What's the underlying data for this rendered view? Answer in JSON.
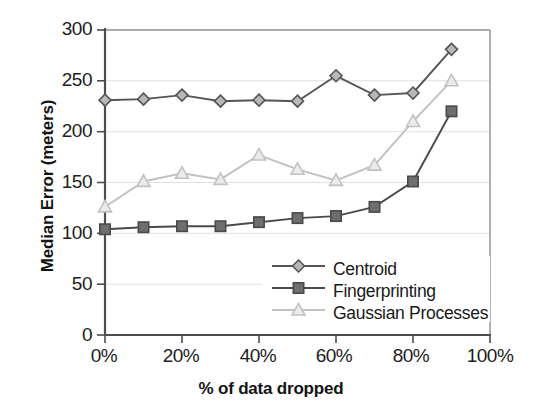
{
  "chart_data": {
    "type": "line",
    "title": "",
    "xlabel": "% of data dropped",
    "ylabel": "Median Error (meters)",
    "x": [
      0,
      10,
      20,
      30,
      40,
      50,
      60,
      70,
      80,
      90
    ],
    "categories": [
      "0%",
      "10%",
      "20%",
      "30%",
      "40%",
      "50%",
      "60%",
      "70%",
      "80%",
      "90%"
    ],
    "xlim": [
      0,
      100
    ],
    "ylim": [
      0,
      300
    ],
    "xticks": [
      0,
      20,
      40,
      60,
      80,
      100
    ],
    "xtick_labels": [
      "0%",
      "20%",
      "40%",
      "60%",
      "80%",
      "100%"
    ],
    "yticks": [
      0,
      50,
      100,
      150,
      200,
      250,
      300
    ],
    "ytick_labels": [
      "0",
      "50",
      "100",
      "150",
      "200",
      "250",
      "300"
    ],
    "grid": true,
    "grid_axis": "y",
    "legend_position": "lower right inside",
    "series": [
      {
        "name": "Centroid",
        "marker": "diamond",
        "color": "#555555",
        "marker_fill": "#b8b8b8",
        "values": [
          231,
          232,
          236,
          230,
          231,
          230,
          255,
          236,
          238,
          281
        ]
      },
      {
        "name": "Fingerprinting",
        "marker": "square",
        "color": "#4a4a4a",
        "marker_fill": "#6e6e6e",
        "values": [
          104,
          106,
          107,
          107,
          111,
          115,
          117,
          126,
          151,
          220
        ]
      },
      {
        "name": "Gaussian Processes",
        "marker": "triangle",
        "color": "#c2c2c2",
        "marker_fill": "#ebebeb",
        "values": [
          126,
          151,
          159,
          153,
          177,
          163,
          152,
          167,
          210,
          250
        ]
      }
    ]
  },
  "legend": {
    "items": [
      {
        "label": "Centroid"
      },
      {
        "label": "Fingerprinting"
      },
      {
        "label": "Gaussian Processes"
      }
    ]
  },
  "axes": {
    "y_title": "Median Error (meters)",
    "x_title": "% of data dropped",
    "y_labels": [
      "300",
      "250",
      "200",
      "150",
      "100",
      "50",
      "0"
    ],
    "x_labels": [
      "0%",
      "20%",
      "40%",
      "60%",
      "80%",
      "100%"
    ]
  },
  "colors": {
    "centroid_line": "#555555",
    "fingerprinting_line": "#4a4a4a",
    "gaussian_line": "#c2c2c2",
    "grid": "#dcdcdc",
    "axis": "#4d4d4d",
    "background": "#ffffff"
  }
}
